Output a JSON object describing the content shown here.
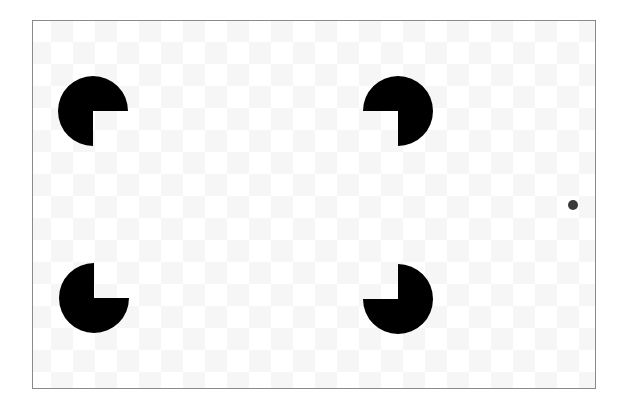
{
  "figure": {
    "frame": {
      "border_color": "#8a8a8a",
      "background": "#ffffff",
      "checker_color": "#f6f6f6",
      "checker_cell_px": 22
    },
    "inducers": [
      {
        "id": "top-left",
        "cx": 93,
        "cy": 111,
        "r": 35,
        "missing_quadrant": "bottom-right",
        "color": "#000000"
      },
      {
        "id": "top-right",
        "cx": 398,
        "cy": 111,
        "r": 35,
        "missing_quadrant": "bottom-left",
        "color": "#000000"
      },
      {
        "id": "bottom-left",
        "cx": 94,
        "cy": 298,
        "r": 35,
        "missing_quadrant": "top-right",
        "color": "#000000"
      },
      {
        "id": "bottom-right",
        "cx": 398,
        "cy": 299,
        "r": 35,
        "missing_quadrant": "top-left",
        "color": "#000000"
      }
    ],
    "fixation_dot": {
      "cx": 573,
      "cy": 205,
      "r": 5,
      "color": "#3a3a3a"
    }
  }
}
